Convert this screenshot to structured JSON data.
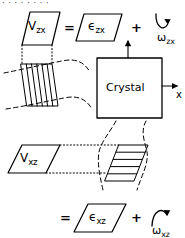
{
  "figure": {
    "width": 185,
    "height": 238,
    "background": "#ffffff",
    "ink": "#000000",
    "topcut_text": "· · · · · · · ·"
  },
  "crystal": {
    "box_label": "Crystal",
    "axis_x_label": "x",
    "axis_z_label": ""
  },
  "top_equation": {
    "shear_label": "V",
    "shear_sub": "zx",
    "equals": "=",
    "strain_label": "ϵ",
    "strain_sub": "zx",
    "plus": "+",
    "rotation_label": "ω",
    "rotation_sub": "zx",
    "rotation_sense": "counterclockwise"
  },
  "bottom_equation": {
    "shear_label": "V",
    "shear_sub": "xz",
    "equals": "=",
    "strain_label": "ϵ",
    "strain_sub": "xz",
    "plus": "+",
    "rotation_label": "ω",
    "rotation_sub": "xz",
    "rotation_sense": "clockwise"
  }
}
